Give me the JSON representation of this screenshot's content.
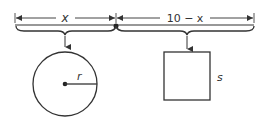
{
  "diagram": {
    "type": "geometry-wire-cut",
    "labels": {
      "left_segment": "x",
      "right_segment": "10 − x",
      "circle_radius": "r",
      "square_side": "s"
    },
    "colors": {
      "stroke": "#333333",
      "background": "#ffffff"
    },
    "shapes": [
      {
        "kind": "segment",
        "label": "x",
        "maps_to": "circle"
      },
      {
        "kind": "segment",
        "label": "10 − x",
        "maps_to": "square"
      },
      {
        "kind": "circle",
        "radius_label": "r"
      },
      {
        "kind": "square",
        "side_label": "s"
      }
    ]
  }
}
